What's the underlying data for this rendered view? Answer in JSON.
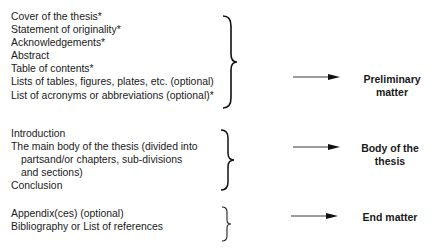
{
  "groups": [
    {
      "items": [
        "Cover of the thesis*",
        "Statement of originality*",
        "Acknowledgements*",
        "Abstract",
        "Table of contents*",
        "Lists of tables, figures, plates, etc. (optional)",
        "List of acronyms or abbreviations (optional)*"
      ],
      "label_line1": "Preliminary",
      "label_line2": "matter"
    },
    {
      "items": [
        "Introduction",
        "The main body of the thesis (divided into",
        "partsand/or chapters, sub-divisions",
        "and sections)",
        "Conclusion"
      ],
      "label_line1": "Body of the",
      "label_line2": "thesis"
    },
    {
      "items": [
        "Appendix(ces) (optional)",
        "Bibliography or List of references"
      ],
      "label_line1": "End matter"
    }
  ]
}
